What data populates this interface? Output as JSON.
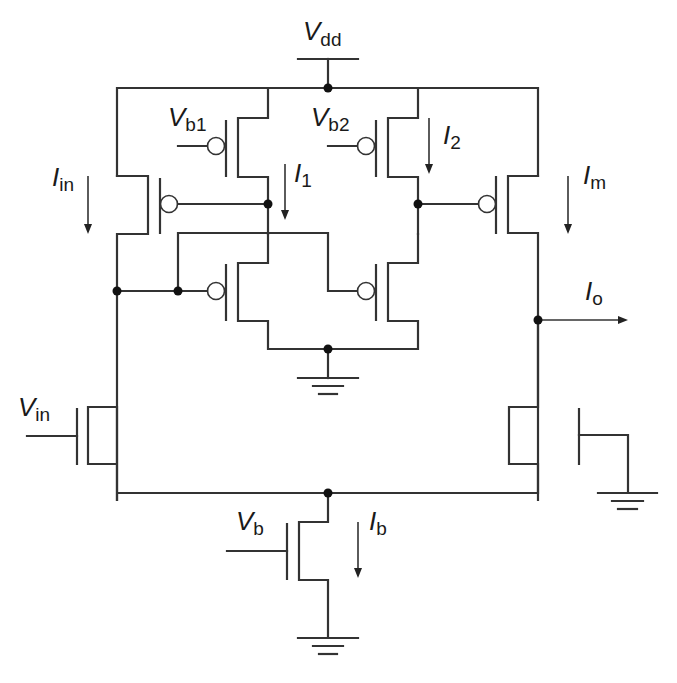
{
  "diagram": {
    "type": "circuit-schematic",
    "title": "",
    "labels": {
      "vdd": {
        "main": "V",
        "sub": "dd"
      },
      "vb1": {
        "main": "V",
        "sub": "b1"
      },
      "vb2": {
        "main": "V",
        "sub": "b2"
      },
      "iin": {
        "main": "I",
        "sub": "in"
      },
      "i1": {
        "main": "I",
        "sub": "1"
      },
      "i2": {
        "main": "I",
        "sub": "2"
      },
      "im": {
        "main": "I",
        "sub": "m"
      },
      "io": {
        "main": "I",
        "sub": "o"
      },
      "vin": {
        "main": "V",
        "sub": "in"
      },
      "vb": {
        "main": "V",
        "sub": "b"
      },
      "ib": {
        "main": "I",
        "sub": "b"
      }
    },
    "components": [
      {
        "id": "M_in_pmos",
        "type": "pmos",
        "gate": "node_A"
      },
      {
        "id": "M_b1",
        "type": "pmos",
        "gate": "Vb1",
        "drain": "node_A"
      },
      {
        "id": "M_b2",
        "type": "pmos",
        "gate": "Vb2",
        "drain": "node_B"
      },
      {
        "id": "M_m",
        "type": "pmos",
        "gate": "node_B"
      },
      {
        "id": "M_cross_left",
        "type": "pmos",
        "gate": "node_in"
      },
      {
        "id": "M_cross_right",
        "type": "pmos",
        "gate": "node_A"
      },
      {
        "id": "M_vin",
        "type": "nmos",
        "gate": "Vin"
      },
      {
        "id": "M_right_diffpair",
        "type": "nmos",
        "gate": "ground"
      },
      {
        "id": "M_tail",
        "type": "nmos",
        "gate": "Vb"
      }
    ],
    "colors": {
      "line": "#333333",
      "node": "#111111",
      "background": "#ffffff"
    }
  }
}
